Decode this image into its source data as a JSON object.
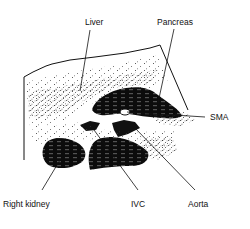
{
  "diagram": {
    "type": "anatomical ultrasound sketch (transverse upper abdomen)",
    "labels": {
      "liver": "Liver",
      "pancreas": "Pancreas",
      "sma": "SMA",
      "right_kidney": "Right kidney",
      "ivc": "IVC",
      "aorta": "Aorta"
    },
    "colors": {
      "ink": "#111111",
      "background": "#ffffff"
    }
  }
}
